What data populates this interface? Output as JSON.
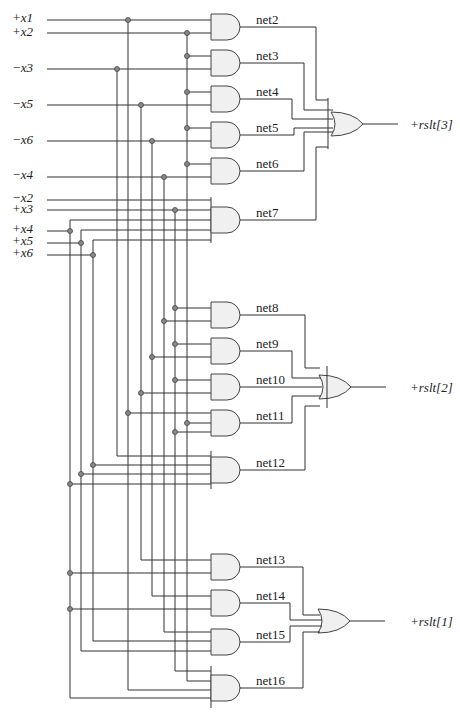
{
  "inputs": {
    "x1": "+x1",
    "x2": "+x2",
    "nx3": "−x3",
    "nx5": "−x5",
    "nx6": "−x6",
    "nx4": "−x4",
    "nx2": "−x2",
    "px3": "+x3",
    "px4": "+x4",
    "px5": "+x5",
    "px6": "+x6"
  },
  "nets": {
    "n2": "net2",
    "n3": "net3",
    "n4": "net4",
    "n5": "net5",
    "n6": "net6",
    "n7": "net7",
    "n8": "net8",
    "n9": "net9",
    "n10": "net10",
    "n11": "net11",
    "n12": "net12",
    "n13": "net13",
    "n14": "net14",
    "n15": "net15",
    "n16": "net16"
  },
  "outputs": {
    "r3": "+rslt[3]",
    "r2": "+rslt[2]",
    "r1": "+rslt[1]"
  }
}
